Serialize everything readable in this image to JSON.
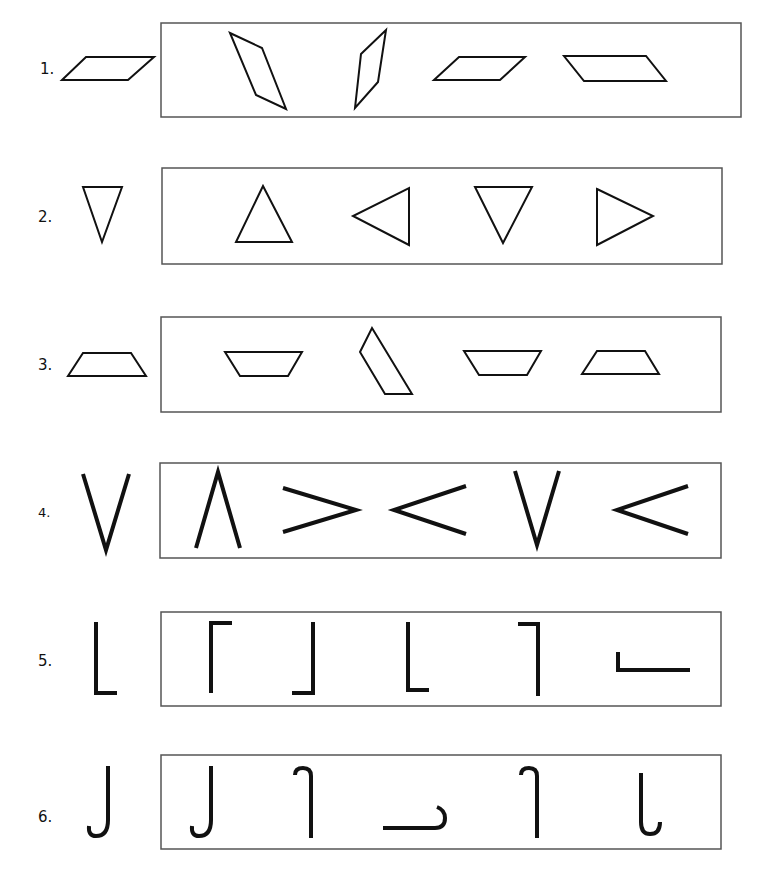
{
  "worksheet": {
    "title": "Shape orientation matching exercise",
    "colors": {
      "ink": "#111111",
      "frame": "#555555",
      "background": "#ffffff"
    },
    "rows": [
      {
        "label": "1.",
        "target": "parallelogram-leaning-right",
        "options": [
          "parallelogram-tall-leaning-left",
          "parallelogram-tall-leaning-right",
          "parallelogram-leaning-right",
          "parallelogram-leaning-left"
        ]
      },
      {
        "label": "2.",
        "target": "triangle-pointing-down",
        "options": [
          "triangle-pointing-up",
          "triangle-pointing-left",
          "triangle-pointing-down",
          "triangle-pointing-right"
        ]
      },
      {
        "label": "3.",
        "target": "trapezoid-wide-base-down",
        "options": [
          "trapezoid-wide-base-up",
          "trapezoid-rotated",
          "trapezoid-wide-base-up",
          "trapezoid-wide-base-down"
        ]
      },
      {
        "label": "4.",
        "target": "v-pointing-down",
        "options": [
          "v-pointing-up",
          "v-pointing-right",
          "v-pointing-left",
          "v-pointing-down",
          "v-pointing-left"
        ]
      },
      {
        "label": "5.",
        "target": "l-bracket-bottom-left",
        "options": [
          "bracket-top-left",
          "bracket-bottom-right",
          "bracket-bottom-left",
          "bracket-top-right",
          "l-bracket-rotated-horizontal"
        ]
      },
      {
        "label": "6.",
        "target": "j-hook-bottom-left",
        "options": [
          "j-hook-bottom-left",
          "hook-top-left",
          "hook-horizontal-right",
          "hook-top-left",
          "hook-bottom-right"
        ]
      }
    ]
  }
}
